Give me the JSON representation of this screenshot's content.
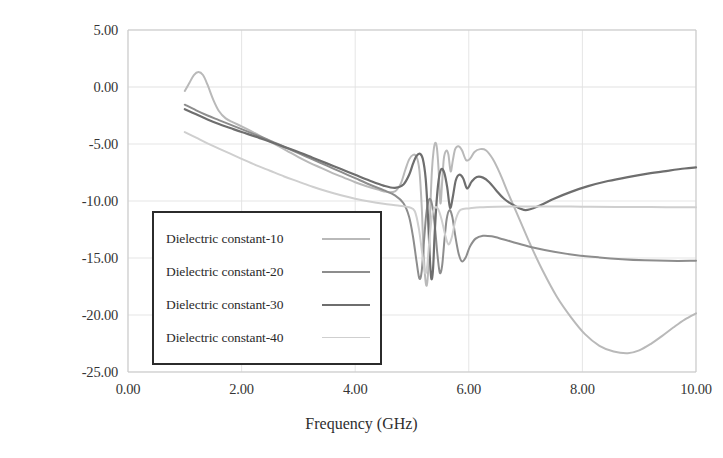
{
  "chart_data": {
    "type": "line",
    "title": "",
    "xlabel": "Frequency (GHz)",
    "ylabel": "S11 (dB)",
    "ylabel_base": "S",
    "ylabel_sub": "11",
    "ylabel_unit": " (dB)",
    "xlim": [
      0.0,
      10.0
    ],
    "ylim": [
      -25.0,
      5.0
    ],
    "xticks": [
      "0.00",
      "2.00",
      "4.00",
      "6.00",
      "8.00",
      "10.00"
    ],
    "xtick_values": [
      0,
      2,
      4,
      6,
      8,
      10
    ],
    "yticks": [
      "5.00",
      "0.00",
      "-5.00",
      "-10.00",
      "-15.00",
      "-20.00",
      "-25.00"
    ],
    "ytick_values": [
      5,
      0,
      -5,
      -10,
      -15,
      -20,
      -25
    ],
    "grid": true,
    "legend_position": "lower-left-inset",
    "colors": {
      "series_10": "#b9b9b9",
      "series_20": "#8d8d8d",
      "series_30": "#6e6e6e",
      "series_40": "#cfcfcf",
      "grid": "#e2e2e2",
      "axis": "#c9c9c9",
      "legend_border": "#2b2b2b",
      "text": "#2e2e2e"
    },
    "series": [
      {
        "name": "Dielectric constant-10",
        "color": "#b9b9b9",
        "width": 2.0,
        "points": [
          [
            1.0,
            -0.35
          ],
          [
            1.08,
            0.35
          ],
          [
            1.16,
            1.05
          ],
          [
            1.24,
            1.32
          ],
          [
            1.32,
            1.05
          ],
          [
            1.4,
            0.2
          ],
          [
            1.5,
            -1.1
          ],
          [
            1.6,
            -2.1
          ],
          [
            1.72,
            -2.75
          ],
          [
            1.85,
            -3.1
          ],
          [
            2.0,
            -3.45
          ],
          [
            2.2,
            -3.95
          ],
          [
            2.4,
            -4.5
          ],
          [
            2.6,
            -5.05
          ],
          [
            2.8,
            -5.6
          ],
          [
            3.0,
            -6.15
          ],
          [
            3.2,
            -6.65
          ],
          [
            3.4,
            -7.1
          ],
          [
            3.6,
            -7.55
          ],
          [
            3.8,
            -7.95
          ],
          [
            4.0,
            -8.35
          ],
          [
            4.2,
            -8.7
          ],
          [
            4.4,
            -9.0
          ],
          [
            4.55,
            -9.2
          ],
          [
            4.7,
            -9.15
          ],
          [
            4.8,
            -8.5
          ],
          [
            4.88,
            -7.3
          ],
          [
            4.95,
            -6.35
          ],
          [
            5.02,
            -5.95
          ],
          [
            5.08,
            -6.1
          ],
          [
            5.13,
            -7.3
          ],
          [
            5.17,
            -10.4
          ],
          [
            5.2,
            -14.0
          ],
          [
            5.23,
            -16.6
          ],
          [
            5.26,
            -17.4
          ],
          [
            5.29,
            -15.6
          ],
          [
            5.32,
            -11.0
          ],
          [
            5.35,
            -7.4
          ],
          [
            5.38,
            -5.6
          ],
          [
            5.41,
            -4.9
          ],
          [
            5.44,
            -5.4
          ],
          [
            5.47,
            -7.4
          ],
          [
            5.5,
            -10.2
          ],
          [
            5.53,
            -8.4
          ],
          [
            5.56,
            -6.3
          ],
          [
            5.6,
            -5.6
          ],
          [
            5.64,
            -5.9
          ],
          [
            5.68,
            -7.4
          ],
          [
            5.72,
            -6.4
          ],
          [
            5.76,
            -5.45
          ],
          [
            5.82,
            -5.2
          ],
          [
            5.88,
            -5.55
          ],
          [
            5.95,
            -6.4
          ],
          [
            6.02,
            -6.3
          ],
          [
            6.1,
            -5.7
          ],
          [
            6.2,
            -5.45
          ],
          [
            6.3,
            -5.55
          ],
          [
            6.42,
            -6.3
          ],
          [
            6.55,
            -7.6
          ],
          [
            6.7,
            -9.4
          ],
          [
            6.9,
            -11.7
          ],
          [
            7.1,
            -14.0
          ],
          [
            7.3,
            -16.1
          ],
          [
            7.55,
            -18.4
          ],
          [
            7.8,
            -20.2
          ],
          [
            8.05,
            -21.7
          ],
          [
            8.3,
            -22.7
          ],
          [
            8.55,
            -23.2
          ],
          [
            8.8,
            -23.35
          ],
          [
            9.0,
            -23.1
          ],
          [
            9.2,
            -22.55
          ],
          [
            9.4,
            -21.85
          ],
          [
            9.6,
            -21.1
          ],
          [
            9.8,
            -20.4
          ],
          [
            10.0,
            -19.85
          ]
        ]
      },
      {
        "name": "Dielectric constant-20",
        "color": "#8d8d8d",
        "width": 2.0,
        "points": [
          [
            1.0,
            -1.55
          ],
          [
            1.2,
            -2.05
          ],
          [
            1.4,
            -2.5
          ],
          [
            1.6,
            -2.9
          ],
          [
            1.8,
            -3.3
          ],
          [
            2.0,
            -3.7
          ],
          [
            2.25,
            -4.2
          ],
          [
            2.5,
            -4.7
          ],
          [
            2.75,
            -5.25
          ],
          [
            3.0,
            -5.8
          ],
          [
            3.25,
            -6.35
          ],
          [
            3.5,
            -6.9
          ],
          [
            3.75,
            -7.45
          ],
          [
            4.0,
            -8.0
          ],
          [
            4.25,
            -8.55
          ],
          [
            4.5,
            -9.05
          ],
          [
            4.7,
            -9.5
          ],
          [
            4.85,
            -10.2
          ],
          [
            4.95,
            -11.4
          ],
          [
            5.02,
            -13.2
          ],
          [
            5.08,
            -15.3
          ],
          [
            5.13,
            -16.8
          ],
          [
            5.17,
            -16.2
          ],
          [
            5.21,
            -13.6
          ],
          [
            5.25,
            -11.2
          ],
          [
            5.29,
            -10.0
          ],
          [
            5.33,
            -9.9
          ],
          [
            5.37,
            -10.8
          ],
          [
            5.41,
            -12.6
          ],
          [
            5.45,
            -14.8
          ],
          [
            5.49,
            -16.3
          ],
          [
            5.53,
            -15.7
          ],
          [
            5.57,
            -13.5
          ],
          [
            5.61,
            -11.6
          ],
          [
            5.66,
            -10.8
          ],
          [
            5.71,
            -11.4
          ],
          [
            5.76,
            -13.0
          ],
          [
            5.82,
            -14.6
          ],
          [
            5.88,
            -15.3
          ],
          [
            5.95,
            -14.9
          ],
          [
            6.02,
            -14.0
          ],
          [
            6.12,
            -13.3
          ],
          [
            6.25,
            -13.05
          ],
          [
            6.4,
            -13.1
          ],
          [
            6.6,
            -13.35
          ],
          [
            6.85,
            -13.7
          ],
          [
            7.15,
            -14.1
          ],
          [
            7.5,
            -14.45
          ],
          [
            7.9,
            -14.75
          ],
          [
            8.3,
            -14.95
          ],
          [
            8.7,
            -15.1
          ],
          [
            9.1,
            -15.2
          ],
          [
            9.5,
            -15.25
          ],
          [
            10.0,
            -15.25
          ]
        ]
      },
      {
        "name": "Dielectric constant-30",
        "color": "#6e6e6e",
        "width": 2.2,
        "points": [
          [
            1.0,
            -1.95
          ],
          [
            1.2,
            -2.4
          ],
          [
            1.4,
            -2.85
          ],
          [
            1.6,
            -3.25
          ],
          [
            1.8,
            -3.6
          ],
          [
            2.0,
            -3.95
          ],
          [
            2.25,
            -4.35
          ],
          [
            2.5,
            -4.8
          ],
          [
            2.75,
            -5.25
          ],
          [
            3.0,
            -5.7
          ],
          [
            3.25,
            -6.2
          ],
          [
            3.5,
            -6.7
          ],
          [
            3.75,
            -7.2
          ],
          [
            4.0,
            -7.7
          ],
          [
            4.25,
            -8.2
          ],
          [
            4.5,
            -8.65
          ],
          [
            4.7,
            -8.85
          ],
          [
            4.85,
            -8.55
          ],
          [
            4.95,
            -7.7
          ],
          [
            5.02,
            -6.7
          ],
          [
            5.08,
            -6.05
          ],
          [
            5.14,
            -5.85
          ],
          [
            5.19,
            -6.3
          ],
          [
            5.24,
            -8.0
          ],
          [
            5.28,
            -11.2
          ],
          [
            5.31,
            -14.6
          ],
          [
            5.34,
            -16.8
          ],
          [
            5.37,
            -16.0
          ],
          [
            5.4,
            -12.8
          ],
          [
            5.44,
            -9.6
          ],
          [
            5.48,
            -7.8
          ],
          [
            5.52,
            -7.2
          ],
          [
            5.57,
            -7.55
          ],
          [
            5.62,
            -8.8
          ],
          [
            5.67,
            -10.6
          ],
          [
            5.72,
            -9.6
          ],
          [
            5.77,
            -8.2
          ],
          [
            5.83,
            -7.7
          ],
          [
            5.9,
            -8.0
          ],
          [
            5.97,
            -8.9
          ],
          [
            6.05,
            -8.3
          ],
          [
            6.14,
            -7.9
          ],
          [
            6.25,
            -7.95
          ],
          [
            6.36,
            -8.35
          ],
          [
            6.48,
            -9.05
          ],
          [
            6.62,
            -9.8
          ],
          [
            6.8,
            -10.4
          ],
          [
            7.0,
            -10.8
          ],
          [
            7.25,
            -10.4
          ],
          [
            7.5,
            -9.8
          ],
          [
            7.8,
            -9.2
          ],
          [
            8.1,
            -8.7
          ],
          [
            8.45,
            -8.25
          ],
          [
            8.8,
            -7.9
          ],
          [
            9.15,
            -7.6
          ],
          [
            9.5,
            -7.35
          ],
          [
            9.8,
            -7.15
          ],
          [
            10.0,
            -7.05
          ]
        ]
      },
      {
        "name": "Dielectric constant-40",
        "color": "#cfcfcf",
        "width": 2.0,
        "points": [
          [
            1.0,
            -3.95
          ],
          [
            1.2,
            -4.45
          ],
          [
            1.4,
            -4.95
          ],
          [
            1.6,
            -5.4
          ],
          [
            1.8,
            -5.85
          ],
          [
            2.0,
            -6.3
          ],
          [
            2.25,
            -6.85
          ],
          [
            2.5,
            -7.35
          ],
          [
            2.75,
            -7.85
          ],
          [
            3.0,
            -8.3
          ],
          [
            3.25,
            -8.75
          ],
          [
            3.5,
            -9.15
          ],
          [
            3.75,
            -9.5
          ],
          [
            4.0,
            -9.8
          ],
          [
            4.25,
            -10.05
          ],
          [
            4.5,
            -10.25
          ],
          [
            4.75,
            -10.4
          ],
          [
            4.95,
            -10.55
          ],
          [
            5.05,
            -10.9
          ],
          [
            5.12,
            -12.4
          ],
          [
            5.18,
            -14.6
          ],
          [
            5.23,
            -16.3
          ],
          [
            5.27,
            -15.6
          ],
          [
            5.31,
            -13.2
          ],
          [
            5.35,
            -11.4
          ],
          [
            5.4,
            -10.6
          ],
          [
            5.46,
            -10.7
          ],
          [
            5.52,
            -11.6
          ],
          [
            5.58,
            -12.9
          ],
          [
            5.64,
            -13.8
          ],
          [
            5.7,
            -13.2
          ],
          [
            5.76,
            -11.8
          ],
          [
            5.83,
            -10.9
          ],
          [
            5.9,
            -10.7
          ],
          [
            6.0,
            -10.65
          ],
          [
            6.2,
            -10.55
          ],
          [
            6.5,
            -10.5
          ],
          [
            6.9,
            -10.48
          ],
          [
            7.4,
            -10.48
          ],
          [
            8.0,
            -10.5
          ],
          [
            8.6,
            -10.52
          ],
          [
            9.2,
            -10.53
          ],
          [
            9.6,
            -10.55
          ],
          [
            10.0,
            -10.55
          ]
        ]
      }
    ]
  },
  "legend": {
    "items": [
      {
        "label": "Dielectric constant-10",
        "color": "#b9b9b9",
        "width": 2.0
      },
      {
        "label": "Dielectric constant-20",
        "color": "#8d8d8d",
        "width": 2.2
      },
      {
        "label": "Dielectric constant-30",
        "color": "#6e6e6e",
        "width": 2.8
      },
      {
        "label": "Dielectric constant-40",
        "color": "#cfcfcf",
        "width": 1.6
      }
    ]
  }
}
